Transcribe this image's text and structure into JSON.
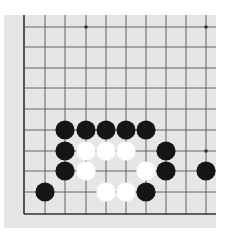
{
  "diagram": {
    "type": "go-board-fragment",
    "grid": {
      "x_lines": [
        24,
        45,
        65,
        86,
        106,
        126,
        146,
        166,
        186,
        206
      ],
      "y_lines": [
        27,
        47,
        68,
        88,
        109,
        130,
        151,
        171,
        192,
        214
      ],
      "left_edge": true,
      "bottom_edge": true,
      "line_color": "#555555",
      "edge_color": "#333333"
    },
    "star_points": [
      {
        "col": 3,
        "row": 0
      },
      {
        "col": 9,
        "row": 0
      },
      {
        "col": 9,
        "row": 6
      }
    ],
    "stones": [
      {
        "color": "black",
        "col": 2,
        "row": 5
      },
      {
        "color": "black",
        "col": 3,
        "row": 5
      },
      {
        "color": "black",
        "col": 4,
        "row": 5
      },
      {
        "color": "black",
        "col": 5,
        "row": 5
      },
      {
        "color": "black",
        "col": 6,
        "row": 5
      },
      {
        "color": "black",
        "col": 2,
        "row": 6
      },
      {
        "color": "white",
        "col": 3,
        "row": 6
      },
      {
        "color": "white",
        "col": 4,
        "row": 6
      },
      {
        "color": "white",
        "col": 5,
        "row": 6
      },
      {
        "color": "black",
        "col": 7,
        "row": 6
      },
      {
        "color": "black",
        "col": 2,
        "row": 7
      },
      {
        "color": "white",
        "col": 3,
        "row": 7
      },
      {
        "color": "white",
        "col": 6,
        "row": 7
      },
      {
        "color": "black",
        "col": 7,
        "row": 7
      },
      {
        "color": "black",
        "col": 9,
        "row": 7
      },
      {
        "color": "black",
        "col": 1,
        "row": 8
      },
      {
        "color": "white",
        "col": 4,
        "row": 8
      },
      {
        "color": "white",
        "col": 5,
        "row": 8
      },
      {
        "color": "black",
        "col": 6,
        "row": 8
      }
    ],
    "colors": {
      "paper": "#e6e6e6",
      "black_stone": "#151515",
      "white_stone": "#ffffff"
    }
  }
}
